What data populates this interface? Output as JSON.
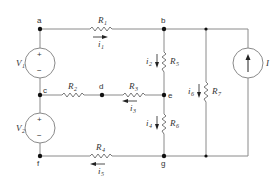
{
  "diagram": {
    "type": "circuit",
    "nodes": [
      "a",
      "b",
      "c",
      "d",
      "e",
      "f",
      "g"
    ],
    "sources": [
      {
        "id": "V1",
        "label": "V",
        "sub": "1",
        "type": "voltage",
        "between": [
          "a",
          "c"
        ],
        "plus": "top",
        "minus": "bottom"
      },
      {
        "id": "V2",
        "label": "V",
        "sub": "2",
        "type": "voltage",
        "between": [
          "c",
          "f"
        ],
        "plus": "top",
        "minus": "bottom"
      },
      {
        "id": "I",
        "label": "I",
        "type": "current",
        "direction": "up"
      }
    ],
    "resistors": [
      {
        "id": "R1",
        "label": "R",
        "sub": "1",
        "between": [
          "a",
          "b"
        ]
      },
      {
        "id": "R2",
        "label": "R",
        "sub": "2",
        "between": [
          "c",
          "d"
        ]
      },
      {
        "id": "R3",
        "label": "R",
        "sub": "3",
        "between": [
          "d",
          "e"
        ]
      },
      {
        "id": "R4",
        "label": "R",
        "sub": "4",
        "between": [
          "f",
          "g"
        ]
      },
      {
        "id": "R5",
        "label": "R",
        "sub": "5",
        "between": [
          "b",
          "e"
        ]
      },
      {
        "id": "R6",
        "label": "R",
        "sub": "6",
        "between": [
          "e",
          "g"
        ]
      },
      {
        "id": "R7",
        "label": "R",
        "sub": "7",
        "between": [
          "top-rail",
          "bottom-rail"
        ]
      }
    ],
    "currents": [
      {
        "id": "i1",
        "label": "i",
        "sub": "1",
        "direction": "right"
      },
      {
        "id": "i2",
        "label": "i",
        "sub": "2",
        "direction": "down"
      },
      {
        "id": "i3",
        "label": "i",
        "sub": "3",
        "direction": "left"
      },
      {
        "id": "i4",
        "label": "i",
        "sub": "4",
        "direction": "down"
      },
      {
        "id": "i5",
        "label": "i",
        "sub": "5",
        "direction": "left"
      },
      {
        "id": "i6",
        "label": "i",
        "sub": "6",
        "direction": "down"
      }
    ],
    "node_labels": {
      "a": "a",
      "b": "b",
      "c": "c",
      "d": "d",
      "e": "e",
      "f": "f",
      "g": "g"
    },
    "symbols": {
      "plus": "+",
      "minus": "−"
    }
  }
}
